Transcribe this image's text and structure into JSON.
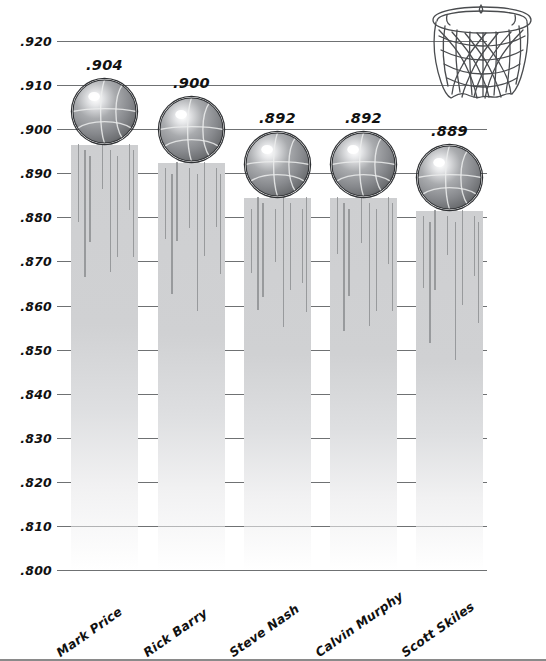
{
  "chart_data": {
    "type": "bar",
    "title": "",
    "subtitle": "",
    "xlabel": "",
    "ylabel": "",
    "categories": [
      "Mark Price",
      "Rick Barry",
      "Steve Nash",
      "Calvin Murphy",
      "Scott Skiles"
    ],
    "values": [
      0.904,
      0.9,
      0.892,
      0.892,
      0.889
    ],
    "value_labels": [
      ".904",
      ".900",
      ".892",
      ".892",
      ".889"
    ],
    "ylim": [
      0.8,
      0.92
    ],
    "ytick_labels": [
      ".920",
      ".910",
      ".900",
      ".890",
      ".880",
      ".870",
      ".860",
      ".850",
      ".840",
      ".830",
      ".820",
      ".810",
      ".800"
    ],
    "ytick_values": [
      0.92,
      0.91,
      0.9,
      0.89,
      0.88,
      0.87,
      0.86,
      0.85,
      0.84,
      0.83,
      0.82,
      0.81,
      0.8
    ],
    "grid": true,
    "legend": "none",
    "marker": "basketball",
    "colors": {
      "gridline": "#6f7173",
      "bar_fill": "#cecfd1",
      "text": "#111111",
      "ball_dark": "#6d6f72",
      "ball_light": "#f2f3f4",
      "ball_outline": "#2f3134",
      "strand": "#8e9093"
    }
  },
  "decorations": {
    "hoop_icon": "basketball-hoop-icon"
  }
}
